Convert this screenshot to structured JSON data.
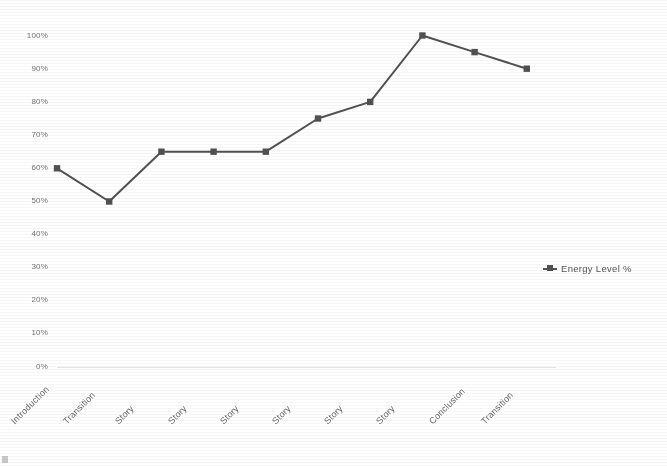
{
  "chart_data": {
    "type": "line",
    "title": "",
    "xlabel": "",
    "ylabel": "",
    "ylim": [
      0,
      100
    ],
    "grid": false,
    "legend_position": "right",
    "series": [
      {
        "name": "Energy Level %",
        "values": [
          60,
          50,
          65,
          65,
          65,
          75,
          80,
          100,
          95,
          90
        ],
        "color": "#4a4a4a",
        "marker": "square"
      }
    ],
    "categories": [
      "Introduction",
      "Transition",
      "Story",
      "Story",
      "Story",
      "Story",
      "Story",
      "Story",
      "Conclusion",
      "Transition"
    ],
    "ytick_labels": [
      "100%",
      "90%",
      "80%",
      "70%",
      "60%",
      "50%",
      "40%",
      "30%",
      "20%",
      "10%",
      "0%"
    ],
    "ytick_values": [
      100,
      90,
      80,
      70,
      60,
      50,
      40,
      30,
      20,
      10,
      0
    ]
  },
  "legend": {
    "entries": [
      {
        "label": "Energy Level %",
        "marker_icon": "line-square-marker-icon"
      }
    ]
  },
  "axis": {
    "baseline_color": "#e2e2e2",
    "tick_text_color": "#6e6e6e"
  }
}
